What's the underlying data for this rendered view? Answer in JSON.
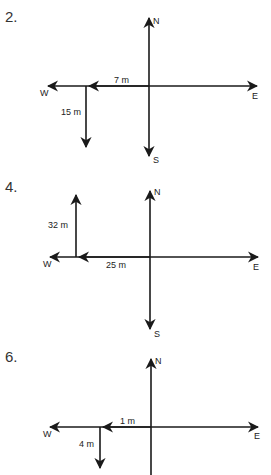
{
  "problems": [
    {
      "number": "2.",
      "compass": {
        "n": "N",
        "s": "S",
        "e": "E",
        "w": "W"
      },
      "vectors": [
        {
          "label": "7 m",
          "direction": "west"
        },
        {
          "label": "15 m",
          "direction": "south"
        }
      ]
    },
    {
      "number": "4.",
      "compass": {
        "n": "N",
        "s": "S",
        "e": "E",
        "w": "W"
      },
      "vectors": [
        {
          "label": "25 m",
          "direction": "west"
        },
        {
          "label": "32 m",
          "direction": "north"
        }
      ]
    },
    {
      "number": "6.",
      "compass": {
        "n": "N",
        "s": "S",
        "e": "E",
        "w": "W"
      },
      "vectors": [
        {
          "label": "1 m",
          "direction": "west"
        },
        {
          "label": "4 m",
          "direction": "south"
        }
      ]
    }
  ],
  "colors": {
    "line": "#1a1a1a",
    "text": "#333333"
  }
}
